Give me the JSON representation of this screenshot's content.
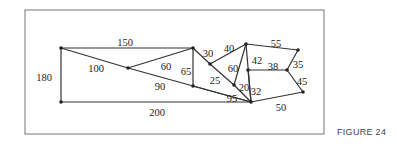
{
  "figure": {
    "caption": "FIGURE 24",
    "frame": {
      "x": 25,
      "y": 10,
      "w": 299,
      "h": 124
    },
    "nodes": [
      {
        "id": "A",
        "x": 61,
        "y": 48
      },
      {
        "id": "B",
        "x": 128,
        "y": 68
      },
      {
        "id": "C",
        "x": 193,
        "y": 48
      },
      {
        "id": "D",
        "x": 193,
        "y": 86
      },
      {
        "id": "E",
        "x": 61,
        "y": 102
      },
      {
        "id": "F",
        "x": 210,
        "y": 64
      },
      {
        "id": "G",
        "x": 246,
        "y": 44
      },
      {
        "id": "H",
        "x": 234,
        "y": 85
      },
      {
        "id": "I",
        "x": 248,
        "y": 70
      },
      {
        "id": "J",
        "x": 251,
        "y": 102
      },
      {
        "id": "K",
        "x": 298,
        "y": 50
      },
      {
        "id": "L",
        "x": 287,
        "y": 70
      },
      {
        "id": "M",
        "x": 303,
        "y": 92
      }
    ],
    "edges": [
      {
        "from": "A",
        "to": "C",
        "weight": "150",
        "lx": 125,
        "ly": 44
      },
      {
        "from": "A",
        "to": "E",
        "weight": "180",
        "lx": 44,
        "ly": 79
      },
      {
        "from": "A",
        "to": "B",
        "weight": "100",
        "lx": 96,
        "ly": 70
      },
      {
        "from": "B",
        "to": "C",
        "weight": "60",
        "lx": 166,
        "ly": 68
      },
      {
        "from": "B",
        "to": "J",
        "weight": "90",
        "lx": 160,
        "ly": 88
      },
      {
        "from": "C",
        "to": "D",
        "weight": "65",
        "lx": 186,
        "ly": 73
      },
      {
        "from": "C",
        "to": "F",
        "weight": "30",
        "lx": 208,
        "ly": 55
      },
      {
        "from": "D",
        "to": "J",
        "weight": "95",
        "lx": 232,
        "ly": 100
      },
      {
        "from": "E",
        "to": "J",
        "weight": "200",
        "lx": 157,
        "ly": 114
      },
      {
        "from": "F",
        "to": "G",
        "weight": "40",
        "lx": 229,
        "ly": 50
      },
      {
        "from": "F",
        "to": "H",
        "weight": "25",
        "lx": 215,
        "ly": 82
      },
      {
        "from": "G",
        "to": "H",
        "weight": "60",
        "lx": 233,
        "ly": 70
      },
      {
        "from": "G",
        "to": "J",
        "weight": "42",
        "lx": 257,
        "ly": 62
      },
      {
        "from": "H",
        "to": "J",
        "weight": "20",
        "lx": 244,
        "ly": 89
      },
      {
        "from": "I",
        "to": "J",
        "weight": "32",
        "lx": 256,
        "ly": 93
      },
      {
        "from": "G",
        "to": "K",
        "weight": "55",
        "lx": 276,
        "ly": 45
      },
      {
        "from": "I",
        "to": "L",
        "weight": "38",
        "lx": 273,
        "ly": 68
      },
      {
        "from": "L",
        "to": "K",
        "weight": "35",
        "lx": 298,
        "ly": 66
      },
      {
        "from": "L",
        "to": "M",
        "weight": "45",
        "lx": 302,
        "ly": 83
      },
      {
        "from": "J",
        "to": "M",
        "weight": "50",
        "lx": 281,
        "ly": 109
      }
    ]
  }
}
